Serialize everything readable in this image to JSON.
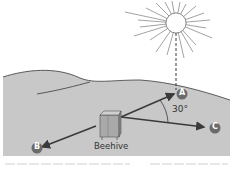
{
  "diagram": {
    "labels": {
      "beehive": "Beehive",
      "angle": "30°",
      "point_a": "A",
      "point_b": "B",
      "point_c": "C"
    },
    "colors": {
      "background": "#ffffff",
      "ground": "#c8c8c8",
      "ground_edge": "#3a3a3a",
      "arrow": "#3a3a3a",
      "marker": "#6b6b6b",
      "marker_text": "#ffffff",
      "sun_stroke": "#7a7a7a",
      "text": "#333333"
    }
  }
}
